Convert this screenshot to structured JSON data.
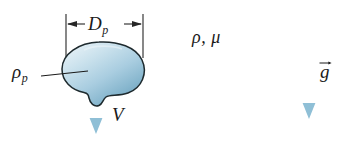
{
  "figure": {
    "background_color": "#ffffff"
  },
  "labels": {
    "diameter": {
      "symbol": "D",
      "subscript": "p",
      "name": "particle-diameter"
    },
    "particle_density": {
      "symbol": "ρ",
      "subscript": "p",
      "name": "particle-density"
    },
    "velocity": {
      "symbol": "V",
      "name": "settling-velocity"
    },
    "fluid_properties": {
      "text": "ρ, μ",
      "name": "fluid-density-viscosity"
    },
    "gravity": {
      "symbol": "g",
      "name": "gravity-vector"
    }
  },
  "colors": {
    "particle_light": "#cfe2ec",
    "particle_mid": "#a8cbdd",
    "particle_dark": "#6b9cb8",
    "particle_outline": "#1e2a2e",
    "arrow_blue": "#8fbfd6",
    "arrow_blue_dark": "#6ba8c4",
    "ground_line": "#4f7f8c",
    "dimension_line": "#262626",
    "text": "#1a1a1a"
  },
  "geometry": {
    "particle_center": {
      "x": 102,
      "y": 72
    },
    "dimension_span": {
      "x1": 66,
      "x2": 143,
      "y": 24
    },
    "velocity_arrow": {
      "x": 96,
      "y1": 70,
      "y2": 133
    },
    "gravity_arrow": {
      "x": 309,
      "y1": 28,
      "y2": 118
    },
    "ground": {
      "x1": 26,
      "x2": 331,
      "y": 157
    }
  }
}
